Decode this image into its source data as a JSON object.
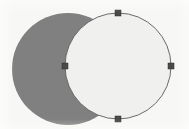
{
  "canvas": {
    "name": "shape-canvas",
    "width": 189,
    "height": 129,
    "background_color": "#f7f7f5",
    "title": "Two overlapping circles, right circle selected"
  },
  "colors": {
    "filled_shape": "#808080",
    "selected_shape_fill": "#f0f0ef",
    "selected_shape_stroke": "#5a5a5a",
    "handle_fill": "#4a4a4a",
    "handle_stroke": "#2e2e2e",
    "canvas_background": "#f7f7f5"
  },
  "shapes": [
    {
      "id": "circle-filled",
      "name": "filled-gray-circle",
      "type": "circle",
      "cx": 68,
      "cy": 69,
      "r": 56,
      "fill": "#808080",
      "stroke": "none",
      "stroke_width": 0,
      "selected": false,
      "z_order": 1,
      "label": "Gray filled circle"
    },
    {
      "id": "circle-outline",
      "name": "selected-outline-circle",
      "type": "circle",
      "cx": 118,
      "cy": 66,
      "r": 53,
      "fill": "#f0f0ef",
      "stroke": "#5a5a5a",
      "stroke_width": 0.9,
      "selected": true,
      "z_order": 2,
      "label": "Outlined circle (selected)"
    }
  ],
  "selection": {
    "name": "selection-handles",
    "target_shape_id": "circle-outline",
    "handle_size": 6,
    "handle_shape": "square",
    "handles": [
      {
        "id": "handle-top",
        "name": "resize-handle-top",
        "position": "top",
        "cx": 118,
        "cy": 13
      },
      {
        "id": "handle-right",
        "name": "resize-handle-right",
        "position": "right",
        "cx": 171,
        "cy": 66
      },
      {
        "id": "handle-bottom",
        "name": "resize-handle-bottom",
        "position": "bottom",
        "cx": 118,
        "cy": 119
      },
      {
        "id": "handle-left",
        "name": "resize-handle-left",
        "position": "left",
        "cx": 65,
        "cy": 66
      }
    ]
  }
}
